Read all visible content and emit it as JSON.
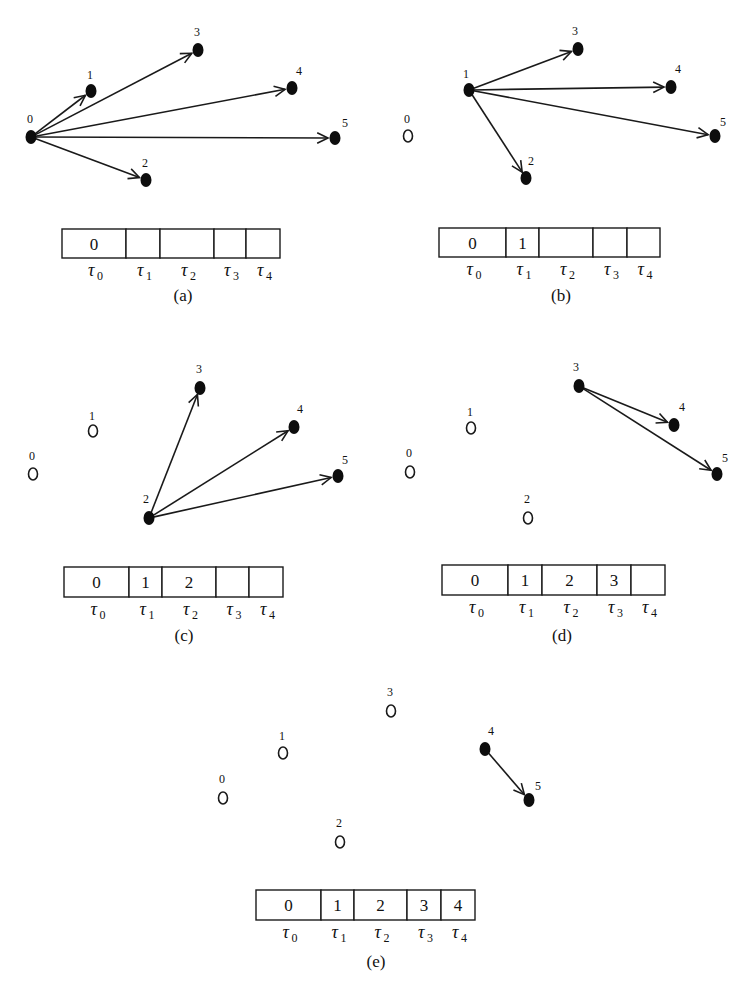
{
  "tau_symbol": "τ",
  "panels": [
    {
      "id": "a",
      "caption": "(a)",
      "nodes": [
        {
          "id": "0",
          "label": "0",
          "x": 31,
          "y": 137,
          "state": "active",
          "lx": -4,
          "ly": -14
        },
        {
          "id": "1",
          "label": "1",
          "x": 91,
          "y": 91,
          "state": "active",
          "lx": -4,
          "ly": -12
        },
        {
          "id": "2",
          "label": "2",
          "x": 146,
          "y": 180,
          "state": "active",
          "lx": -4,
          "ly": -13
        },
        {
          "id": "3",
          "label": "3",
          "x": 198,
          "y": 50,
          "state": "active",
          "lx": -4,
          "ly": -14
        },
        {
          "id": "4",
          "label": "4",
          "x": 292,
          "y": 88,
          "state": "active",
          "lx": 4,
          "ly": -13
        },
        {
          "id": "5",
          "label": "5",
          "x": 335,
          "y": 138,
          "state": "active",
          "lx": 7,
          "ly": -11
        }
      ],
      "edges": [
        {
          "from": "0",
          "to": "1"
        },
        {
          "from": "0",
          "to": "3"
        },
        {
          "from": "0",
          "to": "4"
        },
        {
          "from": "0",
          "to": "5"
        },
        {
          "from": "0",
          "to": "2"
        }
      ],
      "table": {
        "x": 62,
        "y": 229,
        "height": 29,
        "cells": [
          {
            "value": "0",
            "width": 64,
            "tau": "0"
          },
          {
            "value": "",
            "width": 34,
            "tau": "1"
          },
          {
            "value": "",
            "width": 54,
            "tau": "2"
          },
          {
            "value": "",
            "width": 32,
            "tau": "3"
          },
          {
            "value": "",
            "width": 34,
            "tau": "4"
          }
        ]
      },
      "caption_x": 183,
      "caption_y": 301
    },
    {
      "id": "b",
      "caption": "(b)",
      "nodes": [
        {
          "id": "0",
          "label": "0",
          "x": 408,
          "y": 136,
          "state": "done",
          "lx": -4,
          "ly": -13
        },
        {
          "id": "1",
          "label": "1",
          "x": 469,
          "y": 90,
          "state": "active",
          "lx": -6,
          "ly": -12
        },
        {
          "id": "2",
          "label": "2",
          "x": 526,
          "y": 178,
          "state": "active",
          "lx": 2,
          "ly": -13
        },
        {
          "id": "3",
          "label": "3",
          "x": 578,
          "y": 49,
          "state": "active",
          "lx": -6,
          "ly": -14
        },
        {
          "id": "4",
          "label": "4",
          "x": 671,
          "y": 87,
          "state": "active",
          "lx": 4,
          "ly": -14
        },
        {
          "id": "5",
          "label": "5",
          "x": 715,
          "y": 136,
          "state": "active",
          "lx": 5,
          "ly": -10
        }
      ],
      "edges": [
        {
          "from": "1",
          "to": "3"
        },
        {
          "from": "1",
          "to": "4"
        },
        {
          "from": "1",
          "to": "5"
        },
        {
          "from": "1",
          "to": "2"
        }
      ],
      "table": {
        "x": 439,
        "y": 228,
        "height": 29,
        "cells": [
          {
            "value": "0",
            "width": 67,
            "tau": "0"
          },
          {
            "value": "1",
            "width": 33,
            "tau": "1"
          },
          {
            "value": "",
            "width": 54,
            "tau": "2"
          },
          {
            "value": "",
            "width": 34,
            "tau": "3"
          },
          {
            "value": "",
            "width": 33,
            "tau": "4"
          }
        ]
      },
      "caption_x": 561,
      "caption_y": 301
    },
    {
      "id": "c",
      "caption": "(c)",
      "nodes": [
        {
          "id": "0",
          "label": "0",
          "x": 33,
          "y": 474,
          "state": "done",
          "lx": -4,
          "ly": -14
        },
        {
          "id": "1",
          "label": "1",
          "x": 93,
          "y": 431,
          "state": "done",
          "lx": -4,
          "ly": -11
        },
        {
          "id": "2",
          "label": "2",
          "x": 149,
          "y": 518,
          "state": "active",
          "lx": -6,
          "ly": -15
        },
        {
          "id": "3",
          "label": "3",
          "x": 200,
          "y": 388,
          "state": "active",
          "lx": -4,
          "ly": -15
        },
        {
          "id": "4",
          "label": "4",
          "x": 294,
          "y": 427,
          "state": "active",
          "lx": 3,
          "ly": -14
        },
        {
          "id": "5",
          "label": "5",
          "x": 338,
          "y": 476,
          "state": "active",
          "lx": 4,
          "ly": -12
        }
      ],
      "edges": [
        {
          "from": "2",
          "to": "3"
        },
        {
          "from": "2",
          "to": "4"
        },
        {
          "from": "2",
          "to": "5"
        }
      ],
      "table": {
        "x": 64,
        "y": 567,
        "height": 30,
        "cells": [
          {
            "value": "0",
            "width": 65,
            "tau": "0"
          },
          {
            "value": "1",
            "width": 33,
            "tau": "1"
          },
          {
            "value": "2",
            "width": 54,
            "tau": "2"
          },
          {
            "value": "",
            "width": 33,
            "tau": "3"
          },
          {
            "value": "",
            "width": 34,
            "tau": "4"
          }
        ]
      },
      "caption_x": 184,
      "caption_y": 641
    },
    {
      "id": "d",
      "caption": "(d)",
      "nodes": [
        {
          "id": "0",
          "label": "0",
          "x": 410,
          "y": 472,
          "state": "done",
          "lx": -4,
          "ly": -15
        },
        {
          "id": "1",
          "label": "1",
          "x": 471,
          "y": 428,
          "state": "done",
          "lx": -4,
          "ly": -12
        },
        {
          "id": "2",
          "label": "2",
          "x": 528,
          "y": 518,
          "state": "done",
          "lx": -4,
          "ly": -15
        },
        {
          "id": "3",
          "label": "3",
          "x": 579,
          "y": 386,
          "state": "active",
          "lx": -6,
          "ly": -15
        },
        {
          "id": "4",
          "label": "4",
          "x": 674,
          "y": 425,
          "state": "active",
          "lx": 5,
          "ly": -14
        },
        {
          "id": "5",
          "label": "5",
          "x": 717,
          "y": 474,
          "state": "active",
          "lx": 5,
          "ly": -12
        }
      ],
      "edges": [
        {
          "from": "3",
          "to": "4"
        },
        {
          "from": "3",
          "to": "5"
        }
      ],
      "table": {
        "x": 442,
        "y": 565,
        "height": 30,
        "cells": [
          {
            "value": "0",
            "width": 66,
            "tau": "0"
          },
          {
            "value": "1",
            "width": 34,
            "tau": "1"
          },
          {
            "value": "2",
            "width": 55,
            "tau": "2"
          },
          {
            "value": "3",
            "width": 34,
            "tau": "3"
          },
          {
            "value": "",
            "width": 34,
            "tau": "4"
          }
        ]
      },
      "caption_x": 562,
      "caption_y": 641
    },
    {
      "id": "e",
      "caption": "(e)",
      "nodes": [
        {
          "id": "0",
          "label": "0",
          "x": 223,
          "y": 798,
          "state": "done",
          "lx": -4,
          "ly": -15
        },
        {
          "id": "1",
          "label": "1",
          "x": 283,
          "y": 753,
          "state": "done",
          "lx": -4,
          "ly": -13
        },
        {
          "id": "2",
          "label": "2",
          "x": 340,
          "y": 842,
          "state": "done",
          "lx": -4,
          "ly": -15
        },
        {
          "id": "3",
          "label": "3",
          "x": 391,
          "y": 711,
          "state": "done",
          "lx": -4,
          "ly": -15
        },
        {
          "id": "4",
          "label": "4",
          "x": 485,
          "y": 749,
          "state": "active",
          "lx": 3,
          "ly": -14
        },
        {
          "id": "5",
          "label": "5",
          "x": 529,
          "y": 800,
          "state": "active",
          "lx": 6,
          "ly": -10
        }
      ],
      "edges": [
        {
          "from": "4",
          "to": "5"
        }
      ],
      "table": {
        "x": 256,
        "y": 890,
        "height": 30,
        "cells": [
          {
            "value": "0",
            "width": 65,
            "tau": "0"
          },
          {
            "value": "1",
            "width": 33,
            "tau": "1"
          },
          {
            "value": "2",
            "width": 53,
            "tau": "2"
          },
          {
            "value": "3",
            "width": 34,
            "tau": "3"
          },
          {
            "value": "4",
            "width": 34,
            "tau": "4"
          }
        ]
      },
      "caption_x": 376,
      "caption_y": 967
    }
  ]
}
